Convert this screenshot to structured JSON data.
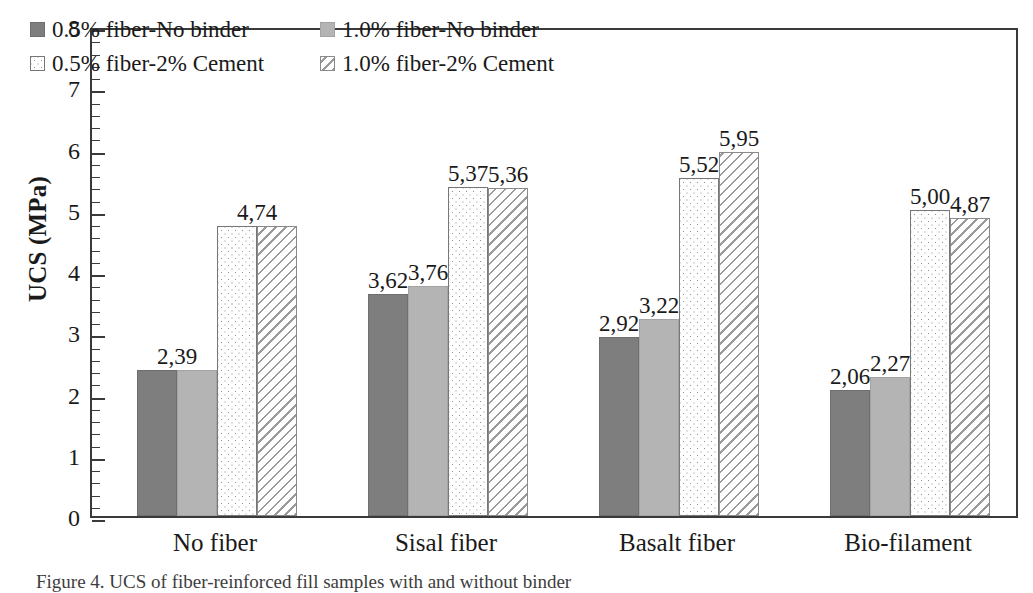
{
  "figure": {
    "caption": "Figure 4.  UCS of fiber-reinforced fill samples with and without binder"
  },
  "chart_data": {
    "type": "bar",
    "title": "",
    "xlabel": "",
    "ylabel": "UCS (MPa)",
    "ylim": [
      0,
      8
    ],
    "ytick_labels": [
      "0",
      "1",
      "2",
      "3",
      "4",
      "5",
      "6",
      "7",
      "8"
    ],
    "ytick_values": [
      0,
      1,
      2,
      3,
      4,
      5,
      6,
      7,
      8
    ],
    "minor_tick_step": 0.2,
    "grid": false,
    "legend_position": "inside-top-left",
    "decimal_separator": ",",
    "categories": [
      "No fiber",
      "Sisal fiber",
      "Basalt fiber",
      "Bio-filament"
    ],
    "series": [
      {
        "name": "0.5% fiber-No binder",
        "pattern": "solid-dark-gray",
        "color": "#7e7e7e",
        "values": [
          2.39,
          3.62,
          2.92,
          2.06
        ],
        "labels": [
          "2,39",
          "3,62",
          "2,92",
          "2,06"
        ],
        "label_shown": [
          true,
          true,
          true,
          true
        ]
      },
      {
        "name": "1.0% fiber-No binder",
        "pattern": "solid-light-gray",
        "color": "#b4b4b4",
        "values": [
          2.39,
          3.76,
          3.22,
          2.27
        ],
        "labels": [
          "2,39",
          "3,76",
          "3,22",
          "2,27"
        ],
        "label_shown": [
          false,
          true,
          true,
          true
        ]
      },
      {
        "name": "0.5% fiber-2% Cement",
        "pattern": "dotted",
        "color": "#ffffff",
        "values": [
          4.74,
          5.37,
          5.52,
          5.0
        ],
        "labels": [
          "4,74",
          "5,37",
          "5,52",
          "5,00"
        ],
        "label_shown": [
          true,
          true,
          true,
          true
        ]
      },
      {
        "name": "1.0% fiber-2% Cement",
        "pattern": "diagonal-hatch",
        "color": "#ffffff",
        "values": [
          4.74,
          5.36,
          5.95,
          4.87
        ],
        "labels": [
          "4,74",
          "5,36",
          "5,95",
          "4,87"
        ],
        "label_shown": [
          false,
          true,
          true,
          true
        ]
      }
    ]
  }
}
